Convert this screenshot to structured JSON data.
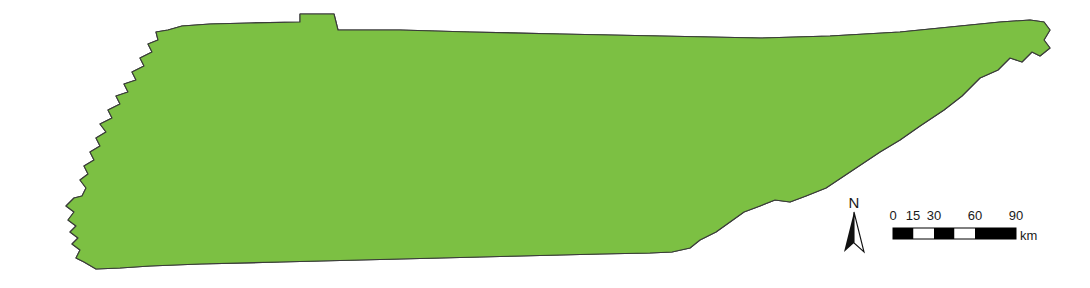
{
  "figure": {
    "background_color": "#ffffff"
  },
  "map": {
    "name": "Tennessee",
    "subject": "state county boundaries with rivers",
    "projection_note": "",
    "fill_colors": {
      "light_green": "#7cc043",
      "mid_green": "#58a84f",
      "dark_green": "#4f9c52",
      "county_border": "#2f3b1f",
      "state_border": "#3a3a3a",
      "river": "#7e9bb5",
      "water_body": "#8aa8c0",
      "white": "#ffffff"
    },
    "county_fill_palette": [
      "#7cc043",
      "#58a84f",
      "#6bb648",
      "#4f9c52",
      "#74bd46"
    ]
  },
  "north_arrow": {
    "label": "N",
    "icon": "north-arrow-icon",
    "color": "#111111"
  },
  "scale_bar": {
    "units": "km",
    "unit_label": "km",
    "tick_labels": [
      "0",
      "15",
      "30",
      "60",
      "90"
    ],
    "tick_values": [
      0,
      15,
      30,
      60,
      90
    ],
    "max_value": 90,
    "segments": [
      {
        "from": 0,
        "to": 15,
        "color": "black"
      },
      {
        "from": 15,
        "to": 30,
        "color": "white"
      },
      {
        "from": 30,
        "to": 45,
        "color": "black"
      },
      {
        "from": 45,
        "to": 60,
        "color": "white"
      },
      {
        "from": 60,
        "to": 90,
        "color": "black"
      }
    ],
    "bar_colors": {
      "black": "#000000",
      "white": "#ffffff",
      "outline": "#000000"
    }
  }
}
